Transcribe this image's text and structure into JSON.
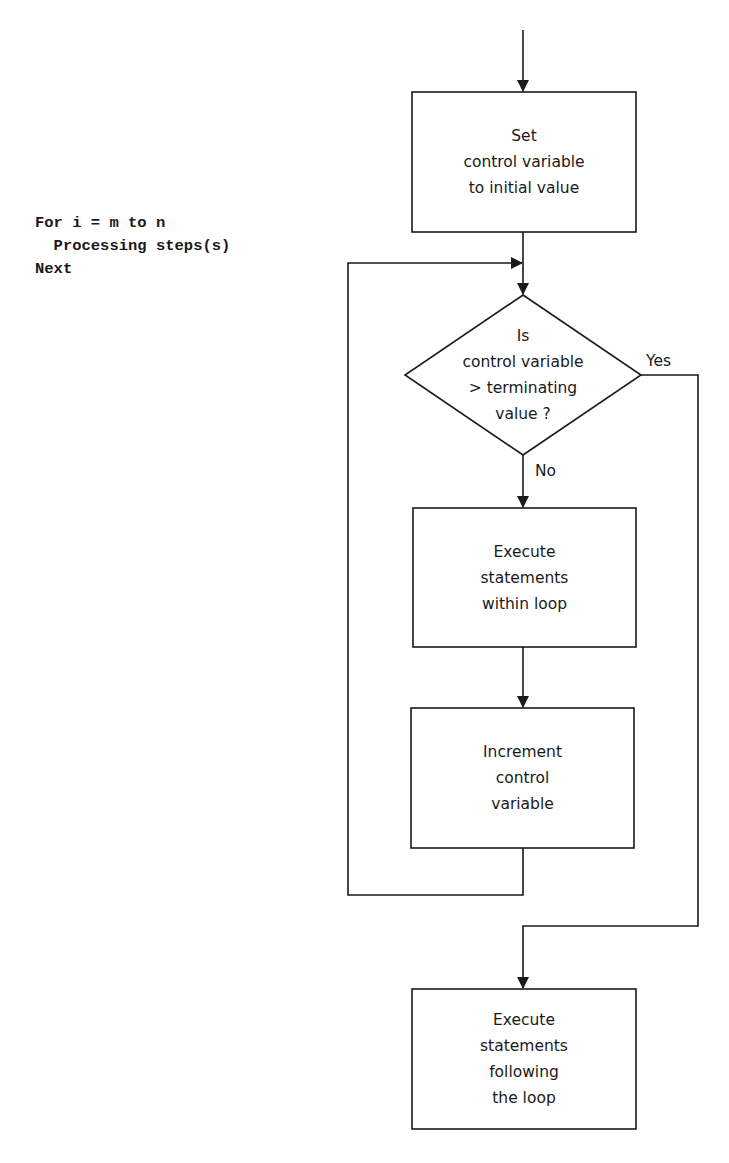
{
  "code": {
    "lines": [
      "For i = m to n",
      "  Processing steps(s)",
      "Next"
    ]
  },
  "flowchart": {
    "nodes": [
      {
        "id": "init",
        "shape": "process",
        "lines": [
          "Set",
          "control variable",
          "to initial value"
        ]
      },
      {
        "id": "test",
        "shape": "decision",
        "lines": [
          "Is",
          "control variable",
          "> terminating",
          "value ?"
        ]
      },
      {
        "id": "body",
        "shape": "process",
        "lines": [
          "Execute",
          "statements",
          "within loop"
        ]
      },
      {
        "id": "increment",
        "shape": "process",
        "lines": [
          "Increment",
          "control",
          "variable"
        ]
      },
      {
        "id": "after",
        "shape": "process",
        "lines": [
          "Execute",
          "statements",
          "following",
          "the loop"
        ]
      }
    ],
    "edge_labels": {
      "yes": "Yes",
      "no": "No"
    },
    "line_color": "#1a1a1a"
  }
}
